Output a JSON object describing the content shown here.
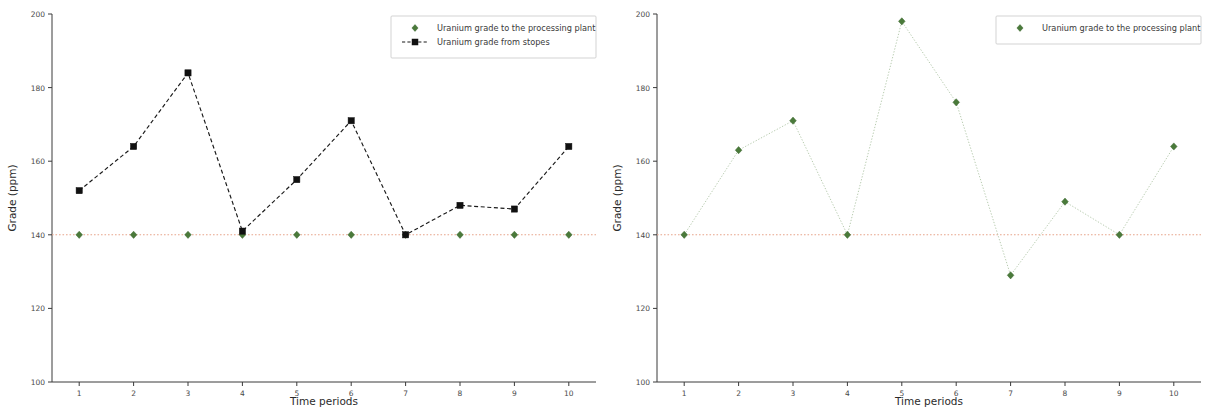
{
  "figure": {
    "panel_count": 2,
    "background_color": "#ffffff"
  },
  "colors": {
    "plant_marker": "#4a7a3a",
    "stopes_marker": "#111111",
    "stopes_line": "#1a1a1a",
    "plant_line": "#b8ccb0",
    "reference_line": "#e8a58c",
    "axis": "#3a3a3a",
    "tick_text": "#4a4a4a"
  },
  "left_panel": {
    "ylabel": "Grade (ppm)",
    "xlabel": "Time periods",
    "ytick_labels": [
      "100",
      "120",
      "140",
      "160",
      "180",
      "200"
    ],
    "xtick_labels": [
      "1",
      "2",
      "3",
      "4",
      "5",
      "6",
      "7",
      "8",
      "9",
      "10"
    ],
    "legend": {
      "items": [
        {
          "label": "Uranium grade to the processing plant",
          "marker": "diamond-marker",
          "color": "#4a7a3a"
        },
        {
          "label": "Uranium grade from stopes",
          "marker": "square-marker",
          "color": "#111111"
        }
      ]
    }
  },
  "right_panel": {
    "ylabel": "Grade (ppm)",
    "xlabel": "Time periods",
    "ytick_labels": [
      "100",
      "120",
      "140",
      "160",
      "180",
      "200"
    ],
    "xtick_labels": [
      "1",
      "2",
      "3",
      "4",
      "5",
      "6",
      "7",
      "8",
      "9",
      "10"
    ],
    "legend": {
      "items": [
        {
          "label": "Uranium grade to the processing plant",
          "marker": "diamond-marker",
          "color": "#4a7a3a"
        }
      ]
    }
  },
  "chart_data": [
    {
      "type": "line",
      "panel": "left",
      "title": "",
      "xlabel": "Time periods",
      "ylabel": "Grade (ppm)",
      "xlim": [
        0.5,
        10.5
      ],
      "ylim": [
        100,
        200
      ],
      "yticks": [
        100,
        120,
        140,
        160,
        180,
        200
      ],
      "xticks": [
        1,
        2,
        3,
        4,
        5,
        6,
        7,
        8,
        9,
        10
      ],
      "grid": false,
      "legend_position": "upper right",
      "categories": [
        1,
        2,
        3,
        4,
        5,
        6,
        7,
        8,
        9,
        10
      ],
      "reference_line": {
        "y": 140,
        "style": "dotted",
        "color": "#e8a58c"
      },
      "series": [
        {
          "name": "Uranium grade to the processing plant",
          "marker": "diamond",
          "color": "#4a7a3a",
          "linestyle": "none",
          "values": [
            140,
            140,
            140,
            140,
            140,
            140,
            140,
            140,
            140,
            140
          ]
        },
        {
          "name": "Uranium grade from stopes",
          "marker": "square",
          "color": "#111111",
          "linestyle": "dashed",
          "values": [
            152,
            164,
            184,
            141,
            155,
            171,
            140,
            148,
            147,
            164
          ]
        }
      ]
    },
    {
      "type": "line",
      "panel": "right",
      "title": "",
      "xlabel": "Time periods",
      "ylabel": "Grade (ppm)",
      "xlim": [
        0.5,
        10.5
      ],
      "ylim": [
        100,
        200
      ],
      "yticks": [
        100,
        120,
        140,
        160,
        180,
        200
      ],
      "xticks": [
        1,
        2,
        3,
        4,
        5,
        6,
        7,
        8,
        9,
        10
      ],
      "grid": false,
      "legend_position": "upper right",
      "categories": [
        1,
        2,
        3,
        4,
        5,
        6,
        7,
        8,
        9,
        10
      ],
      "reference_line": {
        "y": 140,
        "style": "dotted",
        "color": "#e8a58c"
      },
      "series": [
        {
          "name": "Uranium grade to the processing plant",
          "marker": "diamond",
          "color": "#4a7a3a",
          "linestyle": "dotted",
          "values": [
            140,
            163,
            171,
            140,
            198,
            176,
            129,
            149,
            140,
            164
          ]
        }
      ]
    }
  ]
}
